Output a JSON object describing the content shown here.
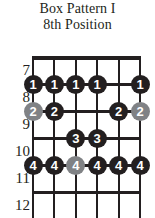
{
  "title": {
    "line1": "Box Pattern I",
    "line2": "8th Position"
  },
  "colors": {
    "primary_dot": "#231f20",
    "secondary_dot": "#808285",
    "board_line": "#231f20",
    "dot_text": "#ffffff",
    "background": "#ffffff"
  },
  "fretboard": {
    "string_count": 6,
    "fret_labels": [
      "7",
      "8",
      "9",
      "10",
      "11",
      "12"
    ],
    "dots": [
      {
        "fret": "8",
        "string": 1,
        "finger": "1",
        "style": "black"
      },
      {
        "fret": "8",
        "string": 2,
        "finger": "1",
        "style": "black"
      },
      {
        "fret": "8",
        "string": 3,
        "finger": "1",
        "style": "black"
      },
      {
        "fret": "8",
        "string": 4,
        "finger": "1",
        "style": "black"
      },
      {
        "fret": "8",
        "string": 6,
        "finger": "1",
        "style": "black"
      },
      {
        "fret": "9",
        "string": 1,
        "finger": "2",
        "style": "gray"
      },
      {
        "fret": "9",
        "string": 2,
        "finger": "2",
        "style": "black"
      },
      {
        "fret": "9",
        "string": 5,
        "finger": "2",
        "style": "black"
      },
      {
        "fret": "9",
        "string": 6,
        "finger": "2",
        "style": "gray"
      },
      {
        "fret": "10",
        "string": 3,
        "finger": "3",
        "style": "black"
      },
      {
        "fret": "10",
        "string": 4,
        "finger": "3",
        "style": "black"
      },
      {
        "fret": "11",
        "string": 1,
        "finger": "4",
        "style": "black"
      },
      {
        "fret": "11",
        "string": 2,
        "finger": "4",
        "style": "black"
      },
      {
        "fret": "11",
        "string": 3,
        "finger": "4",
        "style": "gray"
      },
      {
        "fret": "11",
        "string": 4,
        "finger": "4",
        "style": "black"
      },
      {
        "fret": "11",
        "string": 5,
        "finger": "4",
        "style": "black"
      },
      {
        "fret": "11",
        "string": 6,
        "finger": "4",
        "style": "black"
      }
    ]
  }
}
